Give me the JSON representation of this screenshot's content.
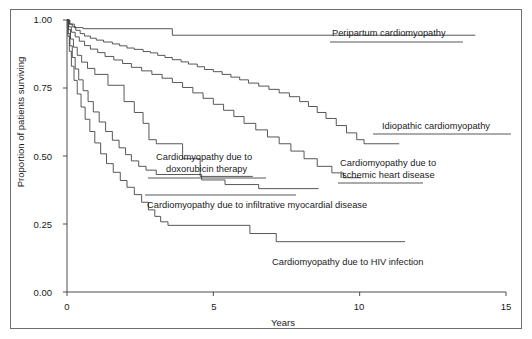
{
  "figure": {
    "border": true,
    "background": "#ffffff",
    "line_color": "#3a3a3a",
    "text_color": "#1a1a1a"
  },
  "axes": {
    "x_title": "Years",
    "y_title": "Proportion of patients surviving",
    "x_ticks": [
      "0",
      "5",
      "10",
      "15"
    ],
    "y_ticks": [
      "0.00",
      "0.25",
      "0.50",
      "0.75",
      "1.00"
    ]
  },
  "chart_data": {
    "type": "line",
    "title": "",
    "subtitle": "",
    "xlabel": "Years",
    "ylabel": "Proportion of patients surviving",
    "xlim": [
      0,
      15
    ],
    "ylim": [
      0.0,
      1.0
    ],
    "xticks": [
      0,
      5,
      10,
      15
    ],
    "yticks": [
      0.0,
      0.25,
      0.5,
      0.75,
      1.0
    ],
    "grid": false,
    "legend": "inline-annotations",
    "annotations": [
      {
        "text": "Peripartum cardiomyopathy",
        "series": "Peripartum cardiomyopathy",
        "x": 10.9,
        "y": 0.945,
        "leader_line": true
      },
      {
        "text": "Idiopathic cardiomyopathy",
        "series": "Idiopathic cardiomyopathy",
        "x": 11.7,
        "y": 0.545,
        "leader_line": true
      },
      {
        "text": "Cardiomyopathy due to ischemic heart disease",
        "series": "Cardiomyopathy due to ischemic heart disease",
        "x": 10.3,
        "y": 0.42,
        "leader_line": true
      },
      {
        "text": "Cardiomyopathy due to doxorubicin therapy",
        "series": "Cardiomyopathy due to doxorubicin therapy",
        "x": 5.0,
        "y": 0.49,
        "leader_line": true
      },
      {
        "text": "Cardiomyopathy due to infiltrative myocardial disease",
        "series": "Cardiomyopathy due to infiltrative myocardial disease",
        "x": 6.4,
        "y": 0.345,
        "leader_line": true
      },
      {
        "text": "Cardiomyopathy due to HIV infection",
        "series": "Cardiomyopathy due to HIV infection",
        "x": 8.4,
        "y": 0.145,
        "leader_line": false
      }
    ],
    "series": [
      {
        "name": "Peripartum cardiomyopathy",
        "points": [
          [
            0.0,
            1.0
          ],
          [
            0.1,
            1.0
          ],
          [
            0.1,
            0.985
          ],
          [
            0.25,
            0.985
          ],
          [
            0.25,
            0.972
          ],
          [
            0.55,
            0.972
          ],
          [
            0.55,
            0.968
          ],
          [
            3.6,
            0.968
          ],
          [
            3.6,
            0.944
          ],
          [
            13.95,
            0.944
          ]
        ]
      },
      {
        "name": "Idiopathic cardiomyopathy",
        "points": [
          [
            0.0,
            1.0
          ],
          [
            0.08,
            1.0
          ],
          [
            0.08,
            0.985
          ],
          [
            0.18,
            0.985
          ],
          [
            0.18,
            0.975
          ],
          [
            0.3,
            0.975
          ],
          [
            0.3,
            0.962
          ],
          [
            0.45,
            0.962
          ],
          [
            0.45,
            0.95
          ],
          [
            0.6,
            0.95
          ],
          [
            0.6,
            0.941
          ],
          [
            0.8,
            0.941
          ],
          [
            0.8,
            0.933
          ],
          [
            1.0,
            0.933
          ],
          [
            1.0,
            0.926
          ],
          [
            1.25,
            0.926
          ],
          [
            1.25,
            0.919
          ],
          [
            1.55,
            0.919
          ],
          [
            1.55,
            0.912
          ],
          [
            1.8,
            0.912
          ],
          [
            1.8,
            0.905
          ],
          [
            2.05,
            0.905
          ],
          [
            2.05,
            0.897
          ],
          [
            2.3,
            0.897
          ],
          [
            2.3,
            0.892
          ],
          [
            2.6,
            0.892
          ],
          [
            2.6,
            0.884
          ],
          [
            2.85,
            0.884
          ],
          [
            2.85,
            0.879
          ],
          [
            3.1,
            0.879
          ],
          [
            3.1,
            0.87
          ],
          [
            3.35,
            0.87
          ],
          [
            3.35,
            0.862
          ],
          [
            3.6,
            0.862
          ],
          [
            3.6,
            0.854
          ],
          [
            3.9,
            0.854
          ],
          [
            3.9,
            0.846
          ],
          [
            4.15,
            0.846
          ],
          [
            4.15,
            0.838
          ],
          [
            4.45,
            0.838
          ],
          [
            4.45,
            0.828
          ],
          [
            4.7,
            0.828
          ],
          [
            4.7,
            0.818
          ],
          [
            5.0,
            0.818
          ],
          [
            5.0,
            0.81
          ],
          [
            5.3,
            0.81
          ],
          [
            5.3,
            0.8
          ],
          [
            5.6,
            0.8
          ],
          [
            5.6,
            0.79
          ],
          [
            5.9,
            0.79
          ],
          [
            5.9,
            0.78
          ],
          [
            6.2,
            0.78
          ],
          [
            6.2,
            0.768
          ],
          [
            6.55,
            0.768
          ],
          [
            6.55,
            0.757
          ],
          [
            6.9,
            0.757
          ],
          [
            6.9,
            0.745
          ],
          [
            7.25,
            0.745
          ],
          [
            7.25,
            0.732
          ],
          [
            7.6,
            0.732
          ],
          [
            7.6,
            0.718
          ],
          [
            7.95,
            0.718
          ],
          [
            7.95,
            0.7
          ],
          [
            8.25,
            0.7
          ],
          [
            8.25,
            0.682
          ],
          [
            8.55,
            0.682
          ],
          [
            8.55,
            0.66
          ],
          [
            8.85,
            0.66
          ],
          [
            8.85,
            0.638
          ],
          [
            9.2,
            0.638
          ],
          [
            9.2,
            0.612
          ],
          [
            9.55,
            0.612
          ],
          [
            9.55,
            0.585
          ],
          [
            9.9,
            0.585
          ],
          [
            9.9,
            0.56
          ],
          [
            10.15,
            0.56
          ],
          [
            10.15,
            0.545
          ],
          [
            11.35,
            0.545
          ]
        ]
      },
      {
        "name": "Cardiomyopathy due to ischemic heart disease",
        "points": [
          [
            0.0,
            1.0
          ],
          [
            0.06,
            1.0
          ],
          [
            0.06,
            0.975
          ],
          [
            0.15,
            0.975
          ],
          [
            0.15,
            0.955
          ],
          [
            0.28,
            0.955
          ],
          [
            0.28,
            0.938
          ],
          [
            0.42,
            0.938
          ],
          [
            0.42,
            0.922
          ],
          [
            0.6,
            0.922
          ],
          [
            0.6,
            0.906
          ],
          [
            0.8,
            0.906
          ],
          [
            0.8,
            0.893
          ],
          [
            1.05,
            0.893
          ],
          [
            1.05,
            0.88
          ],
          [
            1.3,
            0.88
          ],
          [
            1.3,
            0.866
          ],
          [
            1.6,
            0.866
          ],
          [
            1.6,
            0.853
          ],
          [
            1.9,
            0.853
          ],
          [
            1.9,
            0.84
          ],
          [
            2.2,
            0.84
          ],
          [
            2.2,
            0.826
          ],
          [
            2.55,
            0.826
          ],
          [
            2.55,
            0.813
          ],
          [
            2.9,
            0.813
          ],
          [
            2.9,
            0.8
          ],
          [
            3.25,
            0.8
          ],
          [
            3.25,
            0.786
          ],
          [
            3.6,
            0.786
          ],
          [
            3.6,
            0.77
          ],
          [
            3.95,
            0.77
          ],
          [
            3.95,
            0.752
          ],
          [
            4.3,
            0.752
          ],
          [
            4.3,
            0.732
          ],
          [
            4.65,
            0.732
          ],
          [
            4.65,
            0.712
          ],
          [
            5.0,
            0.712
          ],
          [
            5.0,
            0.69
          ],
          [
            5.35,
            0.69
          ],
          [
            5.35,
            0.668
          ],
          [
            5.7,
            0.668
          ],
          [
            5.7,
            0.645
          ],
          [
            6.05,
            0.645
          ],
          [
            6.05,
            0.62
          ],
          [
            6.45,
            0.62
          ],
          [
            6.45,
            0.596
          ],
          [
            6.85,
            0.596
          ],
          [
            6.85,
            0.57
          ],
          [
            7.25,
            0.57
          ],
          [
            7.25,
            0.545
          ],
          [
            7.65,
            0.545
          ],
          [
            7.65,
            0.518
          ],
          [
            8.1,
            0.518
          ],
          [
            8.1,
            0.49
          ],
          [
            8.55,
            0.49
          ],
          [
            8.55,
            0.462
          ],
          [
            9.05,
            0.462
          ],
          [
            9.05,
            0.438
          ],
          [
            9.45,
            0.438
          ],
          [
            9.45,
            0.42
          ],
          [
            10.05,
            0.42
          ]
        ]
      },
      {
        "name": "Cardiomyopathy due to doxorubicin therapy",
        "points": [
          [
            0.0,
            1.0
          ],
          [
            0.05,
            1.0
          ],
          [
            0.05,
            0.965
          ],
          [
            0.12,
            0.965
          ],
          [
            0.12,
            0.93
          ],
          [
            0.22,
            0.93
          ],
          [
            0.22,
            0.9
          ],
          [
            0.35,
            0.9
          ],
          [
            0.35,
            0.87
          ],
          [
            0.5,
            0.87
          ],
          [
            0.5,
            0.845
          ],
          [
            0.7,
            0.845
          ],
          [
            0.7,
            0.822
          ],
          [
            0.95,
            0.822
          ],
          [
            0.95,
            0.8
          ],
          [
            1.4,
            0.8
          ],
          [
            1.4,
            0.76
          ],
          [
            1.95,
            0.76
          ],
          [
            1.95,
            0.7
          ],
          [
            2.3,
            0.7
          ],
          [
            2.3,
            0.66
          ],
          [
            2.6,
            0.66
          ],
          [
            2.6,
            0.62
          ],
          [
            2.8,
            0.62
          ],
          [
            2.8,
            0.56
          ],
          [
            3.05,
            0.56
          ],
          [
            3.05,
            0.545
          ],
          [
            3.95,
            0.545
          ],
          [
            3.95,
            0.49
          ],
          [
            4.55,
            0.49
          ],
          [
            4.55,
            0.425
          ],
          [
            6.35,
            0.425
          ]
        ]
      },
      {
        "name": "Cardiomyopathy due to infiltrative myocardial disease",
        "points": [
          [
            0.0,
            1.0
          ],
          [
            0.04,
            1.0
          ],
          [
            0.04,
            0.95
          ],
          [
            0.1,
            0.95
          ],
          [
            0.1,
            0.905
          ],
          [
            0.18,
            0.905
          ],
          [
            0.18,
            0.862
          ],
          [
            0.28,
            0.862
          ],
          [
            0.28,
            0.82
          ],
          [
            0.4,
            0.82
          ],
          [
            0.4,
            0.78
          ],
          [
            0.55,
            0.78
          ],
          [
            0.55,
            0.74
          ],
          [
            0.72,
            0.74
          ],
          [
            0.72,
            0.7
          ],
          [
            0.9,
            0.7
          ],
          [
            0.9,
            0.662
          ],
          [
            1.1,
            0.662
          ],
          [
            1.1,
            0.625
          ],
          [
            1.32,
            0.625
          ],
          [
            1.32,
            0.59
          ],
          [
            1.55,
            0.59
          ],
          [
            1.55,
            0.558
          ],
          [
            1.78,
            0.558
          ],
          [
            1.78,
            0.53
          ],
          [
            2.0,
            0.53
          ],
          [
            2.0,
            0.505
          ],
          [
            2.2,
            0.505
          ],
          [
            2.2,
            0.482
          ],
          [
            2.45,
            0.482
          ],
          [
            2.45,
            0.462
          ],
          [
            2.7,
            0.462
          ],
          [
            2.7,
            0.448
          ],
          [
            3.05,
            0.448
          ],
          [
            3.05,
            0.432
          ],
          [
            4.6,
            0.432
          ],
          [
            4.6,
            0.412
          ],
          [
            5.4,
            0.412
          ],
          [
            5.4,
            0.395
          ],
          [
            6.55,
            0.395
          ],
          [
            6.55,
            0.38
          ],
          [
            8.6,
            0.38
          ]
        ]
      },
      {
        "name": "Cardiomyopathy due to HIV infection",
        "points": [
          [
            0.0,
            1.0
          ],
          [
            0.03,
            1.0
          ],
          [
            0.03,
            0.94
          ],
          [
            0.08,
            0.94
          ],
          [
            0.08,
            0.885
          ],
          [
            0.15,
            0.885
          ],
          [
            0.15,
            0.83
          ],
          [
            0.24,
            0.83
          ],
          [
            0.24,
            0.778
          ],
          [
            0.35,
            0.778
          ],
          [
            0.35,
            0.728
          ],
          [
            0.48,
            0.728
          ],
          [
            0.48,
            0.68
          ],
          [
            0.62,
            0.68
          ],
          [
            0.62,
            0.635
          ],
          [
            0.78,
            0.635
          ],
          [
            0.78,
            0.59
          ],
          [
            0.95,
            0.59
          ],
          [
            0.95,
            0.548
          ],
          [
            1.15,
            0.548
          ],
          [
            1.15,
            0.508
          ],
          [
            1.35,
            0.508
          ],
          [
            1.35,
            0.472
          ],
          [
            1.58,
            0.472
          ],
          [
            1.58,
            0.44
          ],
          [
            1.82,
            0.44
          ],
          [
            1.82,
            0.41
          ],
          [
            2.05,
            0.41
          ],
          [
            2.05,
            0.385
          ],
          [
            2.3,
            0.385
          ],
          [
            2.3,
            0.358
          ],
          [
            2.55,
            0.358
          ],
          [
            2.55,
            0.33
          ],
          [
            2.78,
            0.33
          ],
          [
            2.78,
            0.302
          ],
          [
            3.0,
            0.302
          ],
          [
            3.0,
            0.278
          ],
          [
            3.2,
            0.278
          ],
          [
            3.2,
            0.258
          ],
          [
            3.45,
            0.258
          ],
          [
            3.45,
            0.245
          ],
          [
            6.25,
            0.245
          ],
          [
            6.25,
            0.215
          ],
          [
            7.15,
            0.215
          ],
          [
            7.15,
            0.185
          ],
          [
            11.55,
            0.185
          ]
        ]
      }
    ]
  }
}
